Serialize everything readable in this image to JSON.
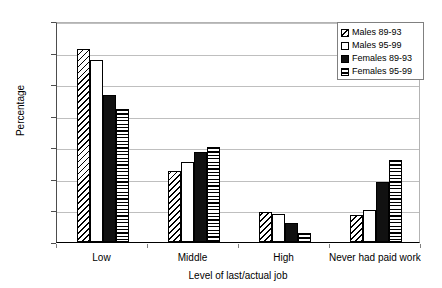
{
  "chart_data": {
    "type": "bar",
    "title": "",
    "xlabel": "Level of last/actual job",
    "ylabel": "Percentage",
    "ylim": [
      0,
      70
    ],
    "ytick_step": 10,
    "yticks": [
      0,
      10,
      20,
      30,
      40,
      50,
      60,
      70
    ],
    "grid": true,
    "legend_position": "top-right",
    "categories": [
      "Low",
      "Middle",
      "High",
      "Never had paid work"
    ],
    "series": [
      {
        "name": "Males 89-93",
        "pattern": "diagonal-hatch",
        "values": [
          61,
          22.5,
          9.5,
          8.6
        ]
      },
      {
        "name": "Males 95-99",
        "pattern": "white-fill",
        "values": [
          57.5,
          25.3,
          8.8,
          10
        ]
      },
      {
        "name": "Females 89-93",
        "pattern": "solid-black",
        "values": [
          46.5,
          28.5,
          6,
          19
        ]
      },
      {
        "name": "Females 95-99",
        "pattern": "horizontal-hatch",
        "values": [
          42,
          30,
          3,
          26
        ]
      }
    ]
  },
  "legend": {
    "entries": [
      "Males 89-93",
      "Males 95-99",
      "Females 89-93",
      "Females 95-99"
    ]
  },
  "colors": {
    "bar_outline": "#000000",
    "gridline": "#bfbfbf",
    "axis": "#4d4d4d",
    "background": "#ffffff"
  }
}
